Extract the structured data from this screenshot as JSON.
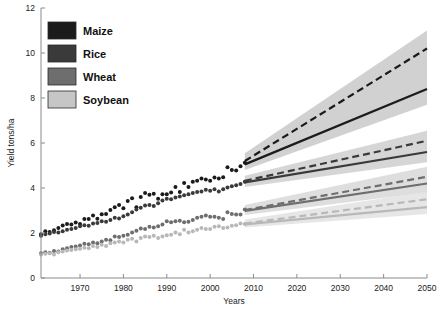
{
  "chart_data": {
    "type": "line",
    "title": "",
    "xlabel": "Years",
    "ylabel": "Yield tons/ha",
    "xlim": [
      1961,
      2050
    ],
    "ylim": [
      0,
      12
    ],
    "xticks": [
      1970,
      1980,
      1990,
      2000,
      2010,
      2020,
      2030,
      2040,
      2050
    ],
    "yticks": [
      0,
      2,
      4,
      6,
      8,
      10,
      12
    ],
    "grid": false,
    "legend_position": "top-left",
    "observed_range": [
      1961,
      2008
    ],
    "projection_range": [
      2008,
      2050
    ],
    "series": [
      {
        "name": "Maize",
        "color": "#1b1b1b",
        "band_color": "#c9c9c9",
        "observed": [
          {
            "x": 1961,
            "y": 1.95
          },
          {
            "x": 1962,
            "y": 2.08
          },
          {
            "x": 1963,
            "y": 2.05
          },
          {
            "x": 1964,
            "y": 2.12
          },
          {
            "x": 1965,
            "y": 2.22
          },
          {
            "x": 1966,
            "y": 2.33
          },
          {
            "x": 1967,
            "y": 2.4
          },
          {
            "x": 1968,
            "y": 2.38
          },
          {
            "x": 1969,
            "y": 2.47
          },
          {
            "x": 1970,
            "y": 2.4
          },
          {
            "x": 1971,
            "y": 2.62
          },
          {
            "x": 1972,
            "y": 2.62
          },
          {
            "x": 1973,
            "y": 2.78
          },
          {
            "x": 1974,
            "y": 2.63
          },
          {
            "x": 1975,
            "y": 2.83
          },
          {
            "x": 1976,
            "y": 2.85
          },
          {
            "x": 1977,
            "y": 3.02
          },
          {
            "x": 1978,
            "y": 3.15
          },
          {
            "x": 1979,
            "y": 3.25
          },
          {
            "x": 1980,
            "y": 3.1
          },
          {
            "x": 1981,
            "y": 3.42
          },
          {
            "x": 1982,
            "y": 3.55
          },
          {
            "x": 1983,
            "y": 3.15
          },
          {
            "x": 1984,
            "y": 3.6
          },
          {
            "x": 1985,
            "y": 3.78
          },
          {
            "x": 1986,
            "y": 3.7
          },
          {
            "x": 1987,
            "y": 3.75
          },
          {
            "x": 1988,
            "y": 3.52
          },
          {
            "x": 1989,
            "y": 3.72
          },
          {
            "x": 1990,
            "y": 3.72
          },
          {
            "x": 1991,
            "y": 3.8
          },
          {
            "x": 1992,
            "y": 4.05
          },
          {
            "x": 1993,
            "y": 3.82
          },
          {
            "x": 1994,
            "y": 4.22
          },
          {
            "x": 1995,
            "y": 4.05
          },
          {
            "x": 1996,
            "y": 4.28
          },
          {
            "x": 1997,
            "y": 4.32
          },
          {
            "x": 1998,
            "y": 4.42
          },
          {
            "x": 1999,
            "y": 4.38
          },
          {
            "x": 2000,
            "y": 4.32
          },
          {
            "x": 2001,
            "y": 4.47
          },
          {
            "x": 2002,
            "y": 4.42
          },
          {
            "x": 2003,
            "y": 4.48
          },
          {
            "x": 2004,
            "y": 4.92
          },
          {
            "x": 2005,
            "y": 4.8
          },
          {
            "x": 2006,
            "y": 4.78
          },
          {
            "x": 2007,
            "y": 4.97
          },
          {
            "x": 2008,
            "y": 5.12
          }
        ],
        "projection_linear": [
          {
            "x": 2008,
            "y": 5.05
          },
          {
            "x": 2050,
            "y": 8.4
          }
        ],
        "projection_exponential": [
          {
            "x": 2008,
            "y": 5.2
          },
          {
            "x": 2050,
            "y": 10.2
          }
        ],
        "band_upper": [
          {
            "x": 2008,
            "y": 5.55
          },
          {
            "x": 2050,
            "y": 11.0
          }
        ],
        "band_lower": [
          {
            "x": 2008,
            "y": 4.8
          },
          {
            "x": 2050,
            "y": 7.7
          }
        ]
      },
      {
        "name": "Rice",
        "color": "#3a3a3a",
        "band_color": "#cfcfcf",
        "observed": [
          {
            "x": 1961,
            "y": 1.88
          },
          {
            "x": 1962,
            "y": 1.95
          },
          {
            "x": 1963,
            "y": 1.98
          },
          {
            "x": 1964,
            "y": 2.05
          },
          {
            "x": 1965,
            "y": 2.02
          },
          {
            "x": 1966,
            "y": 2.08
          },
          {
            "x": 1967,
            "y": 2.14
          },
          {
            "x": 1968,
            "y": 2.18
          },
          {
            "x": 1969,
            "y": 2.22
          },
          {
            "x": 1970,
            "y": 2.3
          },
          {
            "x": 1971,
            "y": 2.35
          },
          {
            "x": 1972,
            "y": 2.32
          },
          {
            "x": 1973,
            "y": 2.42
          },
          {
            "x": 1974,
            "y": 2.45
          },
          {
            "x": 1975,
            "y": 2.52
          },
          {
            "x": 1976,
            "y": 2.5
          },
          {
            "x": 1977,
            "y": 2.58
          },
          {
            "x": 1978,
            "y": 2.68
          },
          {
            "x": 1979,
            "y": 2.65
          },
          {
            "x": 1980,
            "y": 2.75
          },
          {
            "x": 1981,
            "y": 2.82
          },
          {
            "x": 1982,
            "y": 2.92
          },
          {
            "x": 1983,
            "y": 3.05
          },
          {
            "x": 1984,
            "y": 3.12
          },
          {
            "x": 1985,
            "y": 3.22
          },
          {
            "x": 1986,
            "y": 3.25
          },
          {
            "x": 1987,
            "y": 3.2
          },
          {
            "x": 1988,
            "y": 3.32
          },
          {
            "x": 1989,
            "y": 3.45
          },
          {
            "x": 1990,
            "y": 3.52
          },
          {
            "x": 1991,
            "y": 3.5
          },
          {
            "x": 1992,
            "y": 3.58
          },
          {
            "x": 1993,
            "y": 3.62
          },
          {
            "x": 1994,
            "y": 3.68
          },
          {
            "x": 1995,
            "y": 3.72
          },
          {
            "x": 1996,
            "y": 3.78
          },
          {
            "x": 1997,
            "y": 3.82
          },
          {
            "x": 1998,
            "y": 3.85
          },
          {
            "x": 1999,
            "y": 3.92
          },
          {
            "x": 2000,
            "y": 3.88
          },
          {
            "x": 2001,
            "y": 3.95
          },
          {
            "x": 2002,
            "y": 3.85
          },
          {
            "x": 2003,
            "y": 3.95
          },
          {
            "x": 2004,
            "y": 4.02
          },
          {
            "x": 2005,
            "y": 4.08
          },
          {
            "x": 2006,
            "y": 4.12
          },
          {
            "x": 2007,
            "y": 4.18
          },
          {
            "x": 2008,
            "y": 4.28
          }
        ],
        "projection_linear": [
          {
            "x": 2008,
            "y": 4.25
          },
          {
            "x": 2050,
            "y": 5.6
          }
        ],
        "projection_exponential": [
          {
            "x": 2008,
            "y": 4.32
          },
          {
            "x": 2050,
            "y": 6.1
          }
        ],
        "band_upper": [
          {
            "x": 2008,
            "y": 4.55
          },
          {
            "x": 2050,
            "y": 6.55
          }
        ],
        "band_lower": [
          {
            "x": 2008,
            "y": 4.05
          },
          {
            "x": 2050,
            "y": 5.15
          }
        ]
      },
      {
        "name": "Wheat",
        "color": "#6e6e6e",
        "band_color": "#d8d8d8",
        "observed": [
          {
            "x": 1961,
            "y": 1.1
          },
          {
            "x": 1962,
            "y": 1.15
          },
          {
            "x": 1963,
            "y": 1.12
          },
          {
            "x": 1964,
            "y": 1.2
          },
          {
            "x": 1965,
            "y": 1.18
          },
          {
            "x": 1966,
            "y": 1.28
          },
          {
            "x": 1967,
            "y": 1.32
          },
          {
            "x": 1968,
            "y": 1.38
          },
          {
            "x": 1969,
            "y": 1.4
          },
          {
            "x": 1970,
            "y": 1.45
          },
          {
            "x": 1971,
            "y": 1.52
          },
          {
            "x": 1972,
            "y": 1.5
          },
          {
            "x": 1973,
            "y": 1.58
          },
          {
            "x": 1974,
            "y": 1.55
          },
          {
            "x": 1975,
            "y": 1.62
          },
          {
            "x": 1976,
            "y": 1.7
          },
          {
            "x": 1977,
            "y": 1.68
          },
          {
            "x": 1978,
            "y": 1.85
          },
          {
            "x": 1979,
            "y": 1.82
          },
          {
            "x": 1980,
            "y": 1.88
          },
          {
            "x": 1981,
            "y": 1.92
          },
          {
            "x": 1982,
            "y": 2.02
          },
          {
            "x": 1983,
            "y": 2.1
          },
          {
            "x": 1984,
            "y": 2.2
          },
          {
            "x": 1985,
            "y": 2.18
          },
          {
            "x": 1986,
            "y": 2.28
          },
          {
            "x": 1987,
            "y": 2.25
          },
          {
            "x": 1988,
            "y": 2.3
          },
          {
            "x": 1989,
            "y": 2.38
          },
          {
            "x": 1990,
            "y": 2.52
          },
          {
            "x": 1991,
            "y": 2.48
          },
          {
            "x": 1992,
            "y": 2.52
          },
          {
            "x": 1993,
            "y": 2.55
          },
          {
            "x": 1994,
            "y": 2.48
          },
          {
            "x": 1995,
            "y": 2.5
          },
          {
            "x": 1996,
            "y": 2.58
          },
          {
            "x": 1997,
            "y": 2.68
          },
          {
            "x": 1998,
            "y": 2.72
          },
          {
            "x": 1999,
            "y": 2.78
          },
          {
            "x": 2000,
            "y": 2.72
          },
          {
            "x": 2001,
            "y": 2.72
          },
          {
            "x": 2002,
            "y": 2.68
          },
          {
            "x": 2003,
            "y": 2.62
          },
          {
            "x": 2004,
            "y": 2.92
          },
          {
            "x": 2005,
            "y": 2.85
          },
          {
            "x": 2006,
            "y": 2.82
          },
          {
            "x": 2007,
            "y": 2.82
          },
          {
            "x": 2008,
            "y": 3.05
          }
        ],
        "projection_linear": [
          {
            "x": 2008,
            "y": 2.98
          },
          {
            "x": 2050,
            "y": 4.2
          }
        ],
        "projection_exponential": [
          {
            "x": 2008,
            "y": 3.02
          },
          {
            "x": 2050,
            "y": 4.5
          }
        ],
        "band_upper": [
          {
            "x": 2008,
            "y": 3.25
          },
          {
            "x": 2050,
            "y": 4.95
          }
        ],
        "band_lower": [
          {
            "x": 2008,
            "y": 2.8
          },
          {
            "x": 2050,
            "y": 3.8
          }
        ]
      },
      {
        "name": "Soybean",
        "color": "#b8b8b8",
        "band_color": "#e2e2e2",
        "observed": [
          {
            "x": 1961,
            "y": 1.05
          },
          {
            "x": 1962,
            "y": 1.08
          },
          {
            "x": 1963,
            "y": 1.1
          },
          {
            "x": 1964,
            "y": 1.05
          },
          {
            "x": 1965,
            "y": 1.15
          },
          {
            "x": 1966,
            "y": 1.18
          },
          {
            "x": 1967,
            "y": 1.22
          },
          {
            "x": 1968,
            "y": 1.25
          },
          {
            "x": 1969,
            "y": 1.28
          },
          {
            "x": 1970,
            "y": 1.3
          },
          {
            "x": 1971,
            "y": 1.35
          },
          {
            "x": 1972,
            "y": 1.32
          },
          {
            "x": 1973,
            "y": 1.42
          },
          {
            "x": 1974,
            "y": 1.38
          },
          {
            "x": 1975,
            "y": 1.48
          },
          {
            "x": 1976,
            "y": 1.42
          },
          {
            "x": 1977,
            "y": 1.55
          },
          {
            "x": 1978,
            "y": 1.58
          },
          {
            "x": 1979,
            "y": 1.62
          },
          {
            "x": 1980,
            "y": 1.58
          },
          {
            "x": 1981,
            "y": 1.7
          },
          {
            "x": 1982,
            "y": 1.75
          },
          {
            "x": 1983,
            "y": 1.62
          },
          {
            "x": 1984,
            "y": 1.78
          },
          {
            "x": 1985,
            "y": 1.85
          },
          {
            "x": 1986,
            "y": 1.82
          },
          {
            "x": 1987,
            "y": 1.88
          },
          {
            "x": 1988,
            "y": 1.78
          },
          {
            "x": 1989,
            "y": 1.85
          },
          {
            "x": 1990,
            "y": 1.9
          },
          {
            "x": 1991,
            "y": 1.92
          },
          {
            "x": 1992,
            "y": 2.02
          },
          {
            "x": 1993,
            "y": 1.95
          },
          {
            "x": 1994,
            "y": 2.15
          },
          {
            "x": 1995,
            "y": 2.02
          },
          {
            "x": 1996,
            "y": 2.08
          },
          {
            "x": 1997,
            "y": 2.15
          },
          {
            "x": 1998,
            "y": 2.22
          },
          {
            "x": 1999,
            "y": 2.18
          },
          {
            "x": 2000,
            "y": 2.18
          },
          {
            "x": 2001,
            "y": 2.28
          },
          {
            "x": 2002,
            "y": 2.3
          },
          {
            "x": 2003,
            "y": 2.22
          },
          {
            "x": 2004,
            "y": 2.25
          },
          {
            "x": 2005,
            "y": 2.32
          },
          {
            "x": 2006,
            "y": 2.35
          },
          {
            "x": 2007,
            "y": 2.42
          },
          {
            "x": 2008,
            "y": 2.4
          }
        ],
        "projection_linear": [
          {
            "x": 2008,
            "y": 2.38
          },
          {
            "x": 2050,
            "y": 3.15
          }
        ],
        "projection_exponential": [
          {
            "x": 2008,
            "y": 2.42
          },
          {
            "x": 2050,
            "y": 3.5
          }
        ],
        "band_upper": [
          {
            "x": 2008,
            "y": 2.6
          },
          {
            "x": 2050,
            "y": 3.85
          }
        ],
        "band_lower": [
          {
            "x": 2008,
            "y": 2.25
          },
          {
            "x": 2050,
            "y": 2.85
          }
        ]
      }
    ]
  },
  "legend": {
    "items": [
      {
        "label": "Maize",
        "color": "#1b1b1b"
      },
      {
        "label": "Rice",
        "color": "#3a3a3a"
      },
      {
        "label": "Wheat",
        "color": "#6e6e6e"
      },
      {
        "label": "Soybean",
        "color": "#c6c6c6"
      }
    ]
  },
  "axes": {
    "x_title": "Years",
    "y_title": "Yield tons/ha",
    "x_tick_labels": [
      "1970",
      "1980",
      "1990",
      "2000",
      "2010",
      "2020",
      "2030",
      "2040",
      "2050"
    ],
    "y_tick_labels": [
      "0",
      "2",
      "4",
      "6",
      "8",
      "10",
      "12"
    ]
  }
}
